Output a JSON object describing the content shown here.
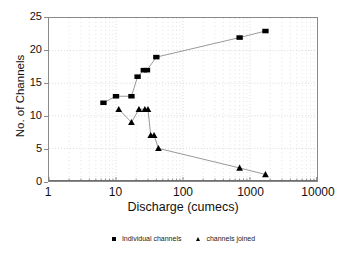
{
  "chart_data": {
    "type": "scatter",
    "title": "",
    "xlabel": "Discharge (cumecs)",
    "ylabel": "No. of Channels",
    "xscale": "log",
    "yscale": "linear",
    "xlim": [
      1,
      10000
    ],
    "ylim": [
      0,
      25
    ],
    "xticks": [
      1,
      10,
      100,
      1000,
      10000
    ],
    "xtick_labels": [
      "1",
      "10",
      "100",
      "1000",
      "10000"
    ],
    "yticks": [
      0,
      5,
      10,
      15,
      20,
      25
    ],
    "ytick_labels": [
      "0",
      "5",
      "10",
      "15",
      "20",
      "25"
    ],
    "grid": true,
    "grid_style": "dotted",
    "grid_color": "#c8c8c8",
    "minor_ticks": true,
    "legend_position": "below",
    "marker_color": "#000000",
    "line_color": "#555555",
    "series": [
      {
        "name": "Individual channels",
        "marker": "square",
        "connected": true,
        "points": [
          {
            "x": 6.5,
            "y": 12
          },
          {
            "x": 10.0,
            "y": 13
          },
          {
            "x": 17.0,
            "y": 13
          },
          {
            "x": 21.0,
            "y": 16
          },
          {
            "x": 26.0,
            "y": 17
          },
          {
            "x": 29.0,
            "y": 17
          },
          {
            "x": 40.0,
            "y": 19
          },
          {
            "x": 700.0,
            "y": 22
          },
          {
            "x": 1700.0,
            "y": 23
          }
        ]
      },
      {
        "name": "channels joined",
        "marker": "triangle",
        "connected": true,
        "points": [
          {
            "x": 11.0,
            "y": 11
          },
          {
            "x": 17.0,
            "y": 9
          },
          {
            "x": 22.0,
            "y": 11
          },
          {
            "x": 27.0,
            "y": 11
          },
          {
            "x": 30.0,
            "y": 11
          },
          {
            "x": 33.0,
            "y": 7
          },
          {
            "x": 37.0,
            "y": 7
          },
          {
            "x": 43.0,
            "y": 5
          },
          {
            "x": 700.0,
            "y": 2
          },
          {
            "x": 1700.0,
            "y": 1
          }
        ]
      }
    ]
  },
  "legend": {
    "items": [
      {
        "label": "Individual channels",
        "marker": "square"
      },
      {
        "label": "channels joined",
        "marker": "triangle"
      }
    ]
  }
}
